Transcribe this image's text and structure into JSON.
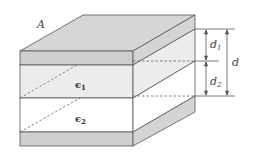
{
  "diagram": {
    "labels": {
      "area": "A",
      "eps1": "ϵ",
      "eps1_sub": "1",
      "eps2": "ϵ",
      "eps2_sub": "2",
      "d1": "d",
      "d1_sub": "1",
      "d2": "d",
      "d2_sub": "2",
      "d": "d"
    },
    "colors": {
      "plate": "#cfcfcf",
      "plate_top": "#d6d6d6",
      "dielectric1": "#ececec",
      "dielectric2": "#ffffff",
      "stroke": "#555555"
    }
  }
}
